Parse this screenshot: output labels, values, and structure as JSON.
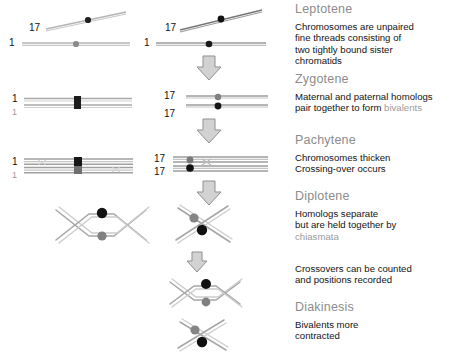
{
  "figure": {
    "title_implicit": "Prophase I stages of meiosis",
    "colors": {
      "heading": "#8c8c8c",
      "body_text": "#141414",
      "muted_term": "#9a9a9a",
      "chromatid_line": "#b0b0b0",
      "centromere_dark": "#1a1a1a",
      "centromere_gray": "#808080",
      "arrow": "#9a9a9a"
    }
  },
  "stages": [
    {
      "name": "Leptotene",
      "lines": [
        {
          "text": "Chromosomes are unpaired"
        },
        {
          "text": "fine threads consisting of"
        },
        {
          "text": "two tightly bound sister"
        },
        {
          "text": "chromatids"
        }
      ]
    },
    {
      "name": "Zygotene",
      "lines": [
        {
          "text": "Maternal and paternal homologs"
        },
        {
          "text": "pair together to form "
        },
        {
          "text": "bivalents",
          "muted": true,
          "inline": true
        }
      ]
    },
    {
      "name": "Pachytene",
      "lines": [
        {
          "text": "Chromosomes thicken"
        },
        {
          "text": "Crossing-over occurs"
        }
      ]
    },
    {
      "name": "Diplotene",
      "lines": [
        {
          "text": "Homologs separate"
        },
        {
          "text": "but are held together by"
        },
        {
          "text": "chiasmata",
          "muted": true
        }
      ]
    },
    {
      "name": "",
      "lines": [
        {
          "text": "Crossovers can be counted"
        },
        {
          "text": "and positions recorded"
        }
      ]
    },
    {
      "name": "Diakinesis",
      "lines": [
        {
          "text": "Bivalents more"
        },
        {
          "text": "contracted"
        }
      ]
    }
  ],
  "text_blocks": {
    "leptotene_title": "Leptotene",
    "leptotene_l1": "Chromosomes are unpaired",
    "leptotene_l2": "fine threads consisting of",
    "leptotene_l3": "two tightly bound sister",
    "leptotene_l4": "chromatids",
    "zygotene_title": "Zygotene",
    "zygotene_l1": "Maternal and paternal homologs",
    "zygotene_l2a": "pair together to form ",
    "zygotene_l2b": "bivalents",
    "pachytene_title": "Pachytene",
    "pachytene_l1": "Chromosomes thicken",
    "pachytene_l2": "Crossing-over occurs",
    "diplotene_title": "Diplotene",
    "diplotene_l1": "Homologs separate",
    "diplotene_l2": "but are held together by",
    "diplotene_l3": "chiasmata",
    "crossover_l1": "Crossovers can be counted",
    "crossover_l2": "and positions recorded",
    "diakinesis_title": "Diakinesis",
    "diakinesis_l1": "Bivalents more",
    "diakinesis_l2": "contracted"
  },
  "chromosome_labels": {
    "c1": "1",
    "c17": "17"
  },
  "diagram_rows": [
    {
      "stage": "Leptotene",
      "left_panel": {
        "chromosome": "1",
        "second_chromosome": "17",
        "form": "single-threads"
      },
      "right_panel": {
        "chromosome": "1",
        "second_chromosome": "17",
        "form": "single-threads",
        "arrow_below": true
      }
    },
    {
      "stage": "Zygotene",
      "left_panel": {
        "chromosome": "1",
        "labels": [
          "1",
          "1"
        ],
        "form": "paired-bivalent"
      },
      "right_panel": {
        "chromosome": "17",
        "labels": [
          "17",
          "17"
        ],
        "form": "paired-bivalent",
        "arrow_below": true
      }
    },
    {
      "stage": "Pachytene",
      "left_panel": {
        "chromosome": "1",
        "labels": [
          "1",
          "1"
        ],
        "form": "thickened-bivalent"
      },
      "right_panel": {
        "chromosome": "17",
        "labels": [
          "17",
          "17"
        ],
        "form": "thickened-bivalent-crossover",
        "arrow_below": true
      }
    },
    {
      "stage": "Diplotene",
      "left_panel": {
        "chromosome": "1",
        "form": "double-cross-chiasmata"
      },
      "right_panel": {
        "chromosome": "17",
        "form": "single-cross-chiasma",
        "arrow_below": true
      }
    },
    {
      "stage": "Diakinesis",
      "right_panel_1": {
        "chromosome": "1",
        "form": "condensed-cross"
      },
      "right_panel_2": {
        "chromosome": "17",
        "form": "condensed-cross-tilted"
      }
    }
  ]
}
